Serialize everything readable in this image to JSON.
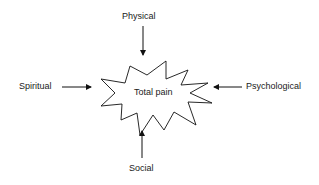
{
  "diagram": {
    "center": "Total pain",
    "inputs": {
      "top": "Physical",
      "left": "Spiritual",
      "right": "Psychological",
      "bottom": "Social"
    }
  }
}
